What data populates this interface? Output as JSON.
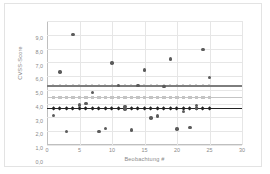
{
  "chart_data": {
    "type": "scatter",
    "title": "",
    "xlabel": "Beobachtung #",
    "ylabel": "CVSS-Score",
    "xlim": [
      0,
      30
    ],
    "ylim": [
      0,
      9
    ],
    "xticks": [
      "0",
      "5",
      "10",
      "15",
      "20",
      "25",
      "30"
    ],
    "xtick_values": [
      0,
      5,
      10,
      15,
      20,
      25,
      30
    ],
    "yticks": [
      "0,0",
      "1,0",
      "2,0",
      "3,0",
      "4,0",
      "5,0",
      "6,0",
      "7,0",
      "8,0",
      "9,0"
    ],
    "ytick_values": [
      0,
      1,
      2,
      3,
      4,
      5,
      6,
      7,
      8,
      9
    ],
    "grid": true,
    "legend": "none",
    "series": [
      {
        "name": "Beobachtungen",
        "marker": "circle",
        "color": "#5b5b5b",
        "points": [
          {
            "x": 1,
            "y": 2.15
          },
          {
            "x": 2,
            "y": 5.3
          },
          {
            "x": 3,
            "y": 1.0
          },
          {
            "x": 4,
            "y": 8.0
          },
          {
            "x": 5,
            "y": 2.9
          },
          {
            "x": 6,
            "y": 3.0
          },
          {
            "x": 7,
            "y": 3.8
          },
          {
            "x": 8,
            "y": 1.0
          },
          {
            "x": 9,
            "y": 1.2
          },
          {
            "x": 10,
            "y": 5.95
          },
          {
            "x": 11,
            "y": 4.3
          },
          {
            "x": 12,
            "y": 2.8
          },
          {
            "x": 12,
            "y": 2.6
          },
          {
            "x": 13,
            "y": 1.1
          },
          {
            "x": 14,
            "y": 4.3
          },
          {
            "x": 15,
            "y": 5.45
          },
          {
            "x": 16,
            "y": 1.95
          },
          {
            "x": 17,
            "y": 2.1
          },
          {
            "x": 18,
            "y": 4.25
          },
          {
            "x": 19,
            "y": 6.25
          },
          {
            "x": 20,
            "y": 1.15
          },
          {
            "x": 21,
            "y": 2.45
          },
          {
            "x": 22,
            "y": 1.25
          },
          {
            "x": 23,
            "y": 2.85
          },
          {
            "x": 23,
            "y": 2.65
          },
          {
            "x": 24,
            "y": 6.95
          },
          {
            "x": 25,
            "y": 4.9
          }
        ]
      }
    ],
    "reference_lines": [
      {
        "name": "Linie oben",
        "marker": "triangle",
        "value": 4.28,
        "color": "#7d7d7d"
      },
      {
        "name": "Linie mitte",
        "marker": "square",
        "value": 3.45,
        "color": "#c4c4c4"
      },
      {
        "name": "Linie unten",
        "marker": "diamond",
        "value": 2.65,
        "color": "#232323"
      }
    ],
    "reference_marker_x": [
      1,
      2,
      3,
      4,
      5,
      6,
      7,
      8,
      9,
      10,
      11,
      12,
      13,
      14,
      15,
      16,
      17,
      18,
      19,
      20,
      21,
      22,
      23,
      24,
      25
    ]
  }
}
